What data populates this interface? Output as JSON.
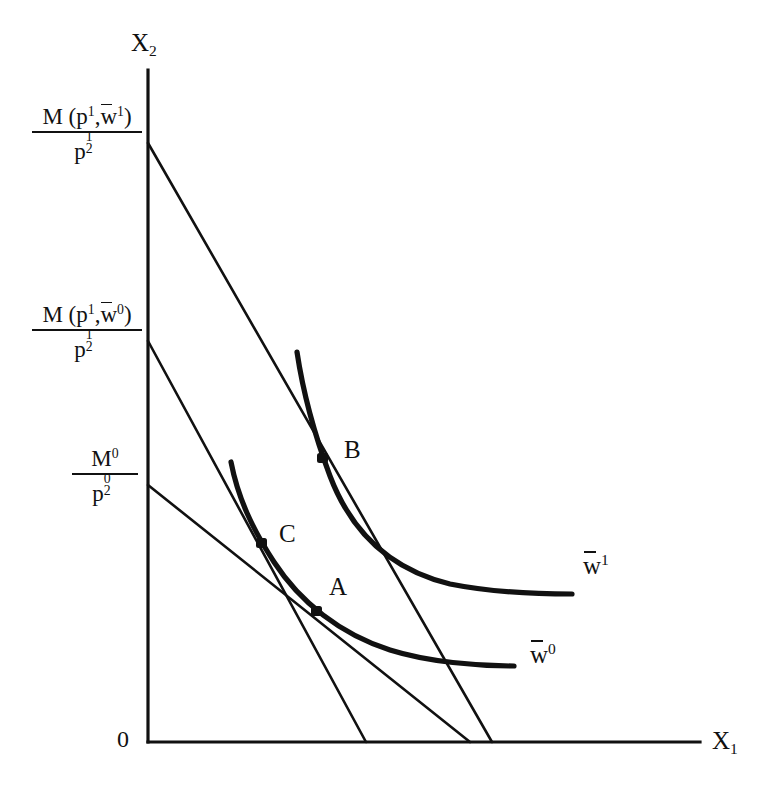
{
  "figure": {
    "background": "#ffffff",
    "ink": "#111111"
  },
  "axes": {
    "y_label": "X",
    "y_label_sub": "2",
    "x_label": "X",
    "x_label_sub": "1",
    "origin_label": "0",
    "origin_px": [
      148,
      742
    ],
    "x_axis_end_px": [
      700,
      742
    ],
    "y_axis_top_px": [
      148,
      70
    ]
  },
  "y_ticks": [
    {
      "id": "tick-high",
      "numerator": "M (p",
      "numerator_sup1": "1",
      "numerator_mid": ",w",
      "numerator_sup2": "1",
      "numerator_end": ")",
      "denominator": "p",
      "den_sup": "1",
      "den_sub": "2",
      "y_px": 143
    },
    {
      "id": "tick-mid",
      "numerator": "M (p",
      "numerator_sup1": "1",
      "numerator_mid": ",w",
      "numerator_sup2": "0",
      "numerator_end": ")",
      "denominator": "p",
      "den_sup": "1",
      "den_sub": "2",
      "y_px": 341
    },
    {
      "id": "tick-low",
      "numerator": "M",
      "numerator_sup1": "0",
      "denominator": "p",
      "den_sup": "0",
      "den_sub": "2",
      "y_px": 485
    }
  ],
  "budget_lines": [
    {
      "name": "budget-line-new-prices-high-income",
      "from_px": [
        148,
        143
      ],
      "to_px": [
        492,
        742
      ],
      "stroke_width": 2.4
    },
    {
      "name": "budget-line-new-prices-compensated",
      "from_px": [
        148,
        341
      ],
      "to_px": [
        366,
        742
      ],
      "stroke_width": 2.4
    },
    {
      "name": "budget-line-original-prices",
      "from_px": [
        148,
        485
      ],
      "to_px": [
        470,
        742
      ],
      "stroke_width": 2.4
    }
  ],
  "indifference_curves": [
    {
      "name": "indifference-curve-w1",
      "label": "w",
      "label_sup": "1",
      "label_px": [
        583,
        566
      ],
      "path": "M 297 352 C 303 392, 312 428, 330 476 C 352 534, 392 570, 450 584 C 490 592, 534 594, 572 594",
      "stroke_width": 5.0
    },
    {
      "name": "indifference-curve-w0",
      "label": "w",
      "label_sup": "0",
      "label_px": [
        530,
        655
      ],
      "path": "M 231 462 C 238 498, 252 528, 274 562 C 300 602, 340 634, 390 650 C 428 662, 478 666, 514 666",
      "stroke_width": 5.0
    }
  ],
  "points": [
    {
      "name": "point-b",
      "label": "B",
      "dot_px": [
        322,
        458
      ],
      "label_px": [
        344,
        440
      ]
    },
    {
      "name": "point-c",
      "label": "C",
      "dot_px": [
        261,
        543
      ],
      "label_px": [
        279,
        524
      ]
    },
    {
      "name": "point-a",
      "label": "A",
      "dot_px": [
        316,
        611
      ],
      "label_px": [
        329,
        577
      ]
    }
  ]
}
